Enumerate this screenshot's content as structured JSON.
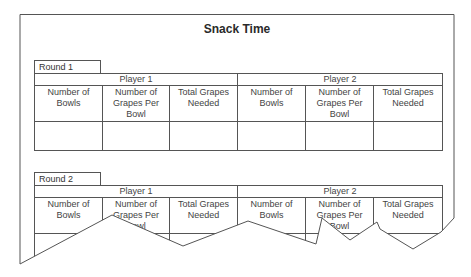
{
  "title": "Snack Time",
  "rounds": [
    {
      "label": "Round 1",
      "players": [
        "Player 1",
        "Player 2"
      ],
      "columns": [
        "Number of Bowls",
        "Number of Grapes Per Bowl",
        "Total Grapes Needed"
      ],
      "rows": [
        [
          "",
          "",
          "",
          "",
          "",
          ""
        ]
      ]
    },
    {
      "label": "Round 2",
      "players": [
        "Player 1",
        "Player 2"
      ],
      "columns": [
        "Number of Bowls",
        "Number of Grapes Per Bowl",
        "Total Grapes Needed"
      ],
      "rows": [
        [
          "",
          "",
          "",
          "",
          "",
          ""
        ]
      ]
    }
  ],
  "colors": {
    "line": "#555555",
    "text": "#333333",
    "background": "#ffffff"
  }
}
